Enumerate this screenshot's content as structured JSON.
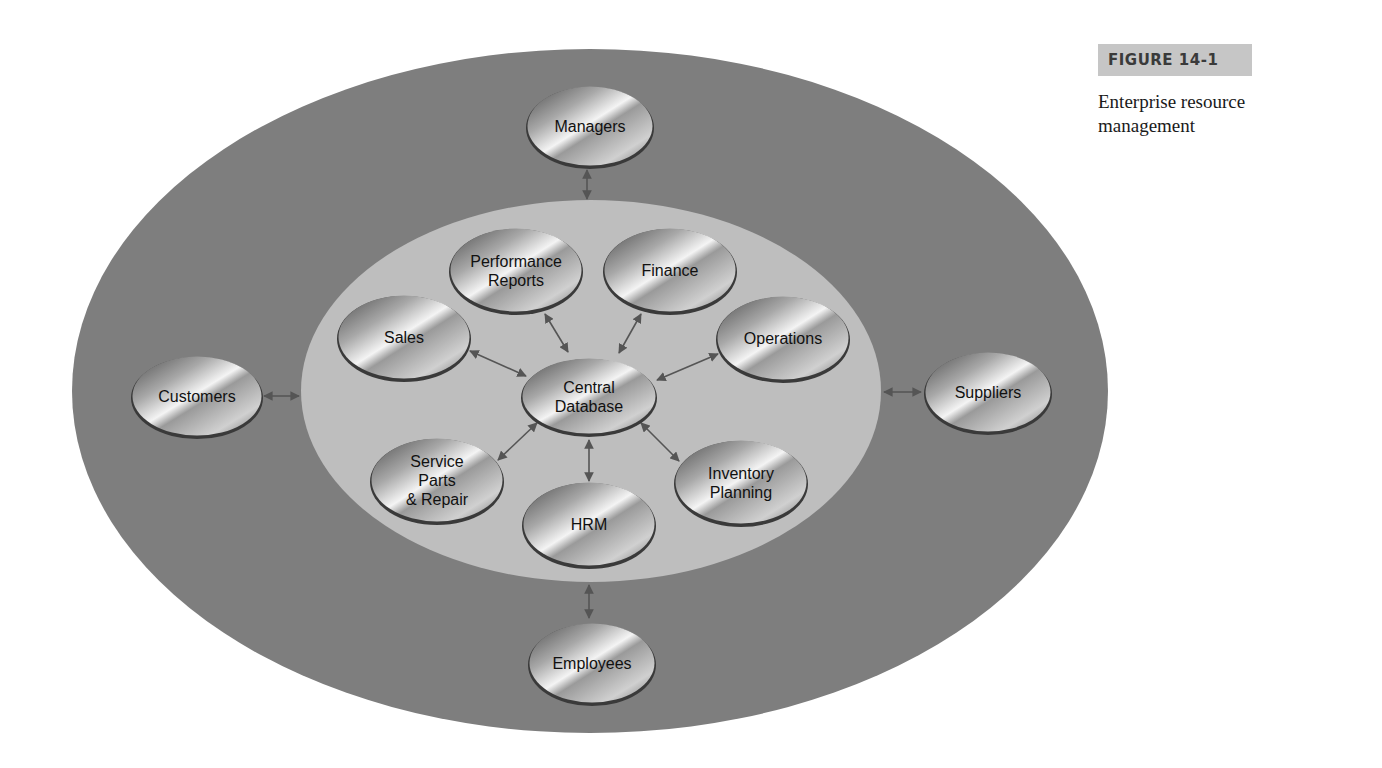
{
  "caption": {
    "figure_number": "FIGURE 14-1",
    "title": "Enterprise resource management"
  },
  "colors": {
    "outer_ring": "#7e7e7e",
    "inner_ring": "#bebebe",
    "node_dark": "#555555",
    "node_light": "#f2f2f2",
    "arrow": "#555555",
    "caption_bg": "#c6c6c6"
  },
  "diagram": {
    "outer_ellipse": {
      "cx": 590,
      "cy": 391,
      "rx": 518,
      "ry": 342
    },
    "inner_ellipse": {
      "cx": 591,
      "cy": 391,
      "rx": 290,
      "ry": 191
    },
    "center_node": {
      "id": "central-database",
      "lines": [
        "Central",
        "Database"
      ],
      "cx": 589,
      "cy": 396,
      "rx": 68,
      "ry": 39
    },
    "inner_nodes": [
      {
        "id": "performance-reports",
        "lines": [
          "Performance",
          "Reports"
        ],
        "cx": 516,
        "cy": 270,
        "rx": 67,
        "ry": 43
      },
      {
        "id": "finance",
        "lines": [
          "Finance"
        ],
        "cx": 670,
        "cy": 270,
        "rx": 67,
        "ry": 43
      },
      {
        "id": "sales",
        "lines": [
          "Sales"
        ],
        "cx": 404,
        "cy": 337,
        "rx": 67,
        "ry": 43
      },
      {
        "id": "operations",
        "lines": [
          "Operations"
        ],
        "cx": 783,
        "cy": 338,
        "rx": 67,
        "ry": 43
      },
      {
        "id": "service-parts-repair",
        "lines": [
          "Service",
          "Parts",
          "& Repair"
        ],
        "cx": 437,
        "cy": 480,
        "rx": 67,
        "ry": 43
      },
      {
        "id": "hrm",
        "lines": [
          "HRM"
        ],
        "cx": 589,
        "cy": 524,
        "rx": 67,
        "ry": 43
      },
      {
        "id": "inventory-planning",
        "lines": [
          "Inventory",
          "Planning"
        ],
        "cx": 741,
        "cy": 482,
        "rx": 67,
        "ry": 43
      }
    ],
    "outer_nodes": [
      {
        "id": "managers",
        "lines": [
          "Managers"
        ],
        "cx": 590,
        "cy": 126,
        "rx": 64,
        "ry": 41
      },
      {
        "id": "customers",
        "lines": [
          "Customers"
        ],
        "cx": 197,
        "cy": 396,
        "rx": 66,
        "ry": 41
      },
      {
        "id": "suppliers",
        "lines": [
          "Suppliers"
        ],
        "cx": 988,
        "cy": 392,
        "rx": 64,
        "ry": 41
      },
      {
        "id": "employees",
        "lines": [
          "Employees"
        ],
        "cx": 592,
        "cy": 663,
        "rx": 64,
        "ry": 41
      }
    ],
    "arrows": [
      {
        "from": "managers",
        "x1": 587,
        "y1": 170,
        "x2": 587,
        "y2": 199
      },
      {
        "from": "customers",
        "x1": 264,
        "y1": 396,
        "x2": 299,
        "y2": 396
      },
      {
        "from": "suppliers",
        "x1": 884,
        "y1": 392,
        "x2": 921,
        "y2": 392
      },
      {
        "from": "employees",
        "x1": 589,
        "y1": 585,
        "x2": 589,
        "y2": 618
      },
      {
        "from": "performance-reports",
        "x1": 545,
        "y1": 314,
        "x2": 568,
        "y2": 352
      },
      {
        "from": "finance",
        "x1": 641,
        "y1": 314,
        "x2": 619,
        "y2": 353
      },
      {
        "from": "sales",
        "x1": 470,
        "y1": 351,
        "x2": 526,
        "y2": 376
      },
      {
        "from": "operations",
        "x1": 718,
        "y1": 354,
        "x2": 657,
        "y2": 380
      },
      {
        "from": "service-parts-repair",
        "x1": 498,
        "y1": 460,
        "x2": 537,
        "y2": 423
      },
      {
        "from": "hrm",
        "x1": 589,
        "y1": 440,
        "x2": 589,
        "y2": 481
      },
      {
        "from": "inventory-planning",
        "x1": 679,
        "y1": 461,
        "x2": 641,
        "y2": 423
      }
    ]
  }
}
